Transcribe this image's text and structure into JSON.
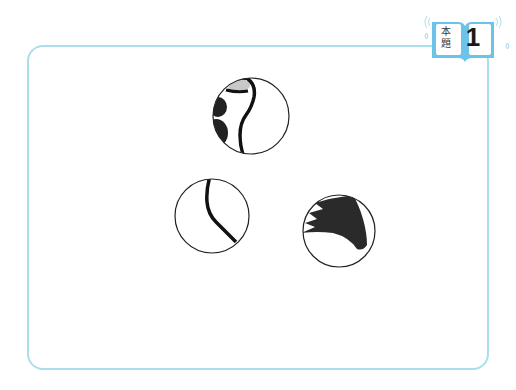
{
  "badge": {
    "label": "本\n題",
    "label_line1": "本",
    "label_line2": "題",
    "number": "1",
    "color": "#6cc3ea"
  },
  "frame": {
    "border_color": "#a9dfe9"
  },
  "puzzle_circles": [
    {
      "name": "detail-circle-top",
      "description": "close-up of curved outline with gray and black shapes"
    },
    {
      "name": "detail-circle-left",
      "description": "close-up of a single curved black line"
    },
    {
      "name": "detail-circle-right",
      "description": "close-up of black spiky shape"
    }
  ]
}
